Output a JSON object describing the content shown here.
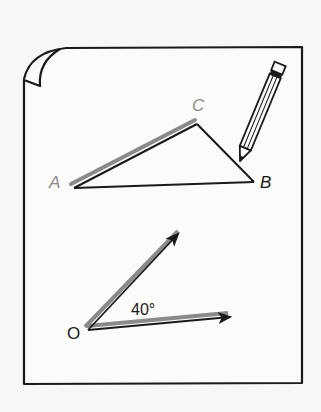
{
  "figure": {
    "colors": {
      "background": "#f7f7f5",
      "paper": "#fbfbf9",
      "ink": "#1a1a1a",
      "highlight": "#8a8a8a"
    },
    "triangle": {
      "vertices": {
        "A": {
          "label": "A",
          "x": 73,
          "y": 187
        },
        "B": {
          "label": "B",
          "x": 253,
          "y": 181
        },
        "C": {
          "label": "C",
          "x": 197,
          "y": 122
        }
      },
      "highlighted_side": "AC"
    },
    "angle": {
      "vertex_label": "O",
      "value_label": "40°",
      "vertex": {
        "x": 87,
        "y": 329
      },
      "ray1_end": {
        "x": 180,
        "y": 232
      },
      "ray2_end": {
        "x": 232,
        "y": 316
      }
    },
    "pencil": {
      "tip": {
        "x": 240,
        "y": 161
      },
      "end": {
        "x": 280,
        "y": 65
      }
    }
  }
}
